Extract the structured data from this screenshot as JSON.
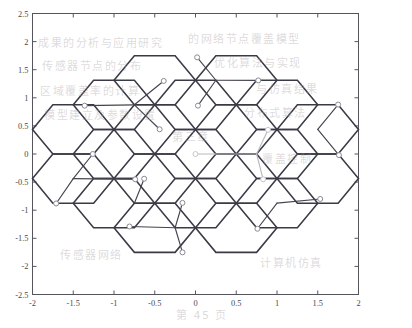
{
  "figure": {
    "title": "",
    "background_color": "#ffffff",
    "axes_color": "#55555d",
    "hex_edge_color": "#3a3a46",
    "star_line_color": "#44444e",
    "star_line_color_faded": "#b9b9c0",
    "marker_face_color": "#ffffff",
    "marker_edge_color": "#8a8a93",
    "marker_edge_color_faded": "#c7c7cd"
  },
  "chart_data": {
    "type": "scatter",
    "title": "",
    "xlabel": "",
    "ylabel": "",
    "xlim": [
      -2,
      2
    ],
    "ylim": [
      -2.5,
      2.5
    ],
    "grid": false,
    "legend": null,
    "xticks": [
      -2,
      -1.5,
      -1,
      -0.5,
      0,
      0.5,
      1,
      1.5,
      2
    ],
    "xticklabels": [
      "-2",
      "-1.5",
      "-1",
      "-0.5",
      "0",
      "0.5",
      "1",
      "1.5",
      "2"
    ],
    "yticks": [
      -2.5,
      -2,
      -1.5,
      -1,
      -0.5,
      0,
      0.5,
      1,
      1.5,
      2,
      2.5
    ],
    "yticklabels": [
      "-2.5",
      "-2",
      "-1.5",
      "-1",
      "-0.5",
      "0",
      "0.5",
      "1",
      "1.5",
      "2",
      "2.5"
    ],
    "hex_geometry": {
      "circumradius": 0.5,
      "flat_half_width": 0.433,
      "orientation": "pointy-left-right",
      "centers": [
        [
          -1.5,
          1.75
        ],
        [
          -0.5,
          1.75
        ],
        [
          0.5,
          1.75
        ],
        [
          1.5,
          1.75
        ],
        [
          -1.5,
          0.875
        ],
        [
          -0.5,
          0.875
        ],
        [
          0.5,
          0.875
        ],
        [
          1.5,
          0.875
        ],
        [
          -1.0,
          1.3125
        ],
        [
          0.0,
          1.3125
        ],
        [
          1.0,
          1.3125
        ]
      ],
      "note": "Actual rendered lattice is built programmatically in the template from row/column offsets; see hex_rows."
    },
    "hex_rows": [
      {
        "y": 1.3125,
        "x_centers": [
          0.0
        ]
      },
      {
        "y": 0.4375,
        "x_centers": [
          -0.75,
          0.0,
          0.75
        ]
      },
      {
        "y": 0.0,
        "x_centers": [
          -1.5,
          -0.75,
          0.0,
          0.75,
          1.5
        ]
      },
      {
        "y": -0.4375,
        "x_centers": [
          -1.5,
          -0.75,
          0.0,
          0.75,
          1.5
        ]
      },
      {
        "y": -1.3125,
        "x_centers": [
          0.0
        ]
      }
    ],
    "stars": [
      {
        "id": "star-1",
        "origin": [
          -0.75,
          0.875
        ],
        "faded": false,
        "arms": [
          {
            "angle_deg": 55,
            "length": 0.62,
            "endpoint": [
              -0.39,
              1.3
            ]
          },
          {
            "angle_deg": 175,
            "length": 0.62,
            "endpoint": [
              -1.36,
              0.86
            ]
          },
          {
            "angle_deg": -60,
            "length": 0.62,
            "endpoint": [
              -0.44,
              0.44
            ]
          }
        ]
      },
      {
        "id": "star-2",
        "origin": [
          0.25,
          1.3125
        ],
        "faded": false,
        "arms": [
          {
            "angle_deg": 100,
            "length": 0.5,
            "endpoint": [
              0.02,
              1.72
            ]
          },
          {
            "angle_deg": 5,
            "length": 0.52,
            "endpoint": [
              0.77,
              1.31
            ]
          },
          {
            "angle_deg": -105,
            "length": 0.62,
            "endpoint": [
              0.03,
              0.86
            ]
          }
        ]
      },
      {
        "id": "star-3",
        "origin": [
          1.5,
          0.4375
        ],
        "faded": false,
        "arms": [
          {
            "angle_deg": 62,
            "length": 0.58,
            "endpoint": [
              1.75,
              0.88
            ]
          },
          {
            "angle_deg": -62,
            "length": 0.58,
            "endpoint": [
              1.76,
              -0.02
            ]
          },
          {
            "angle_deg": 180,
            "length": 0.0,
            "endpoint": [
              1.5,
              0.4375
            ]
          }
        ]
      },
      {
        "id": "star-4",
        "origin": [
          0.75,
          0.0
        ],
        "faded": true,
        "arms": [
          {
            "angle_deg": 72,
            "length": 0.45,
            "endpoint": [
              0.89,
              0.43
            ]
          },
          {
            "angle_deg": 180,
            "length": 0.75,
            "endpoint": [
              0.0,
              0.0
            ]
          },
          {
            "angle_deg": -80,
            "length": 0.46,
            "endpoint": [
              0.83,
              -0.45
            ]
          }
        ]
      },
      {
        "id": "star-5",
        "origin": [
          -1.5,
          -0.4375
        ],
        "faded": false,
        "arms": [
          {
            "angle_deg": 60,
            "length": 0.48,
            "endpoint": [
              -1.26,
              0.0
            ]
          },
          {
            "angle_deg": -5,
            "length": 0.76,
            "endpoint": [
              -0.74,
              -0.45
            ]
          },
          {
            "angle_deg": -115,
            "length": 0.5,
            "endpoint": [
              -1.71,
              -0.88
            ]
          }
        ]
      },
      {
        "id": "star-6",
        "origin": [
          -0.75,
          -0.875
        ],
        "faded": false,
        "arms": [
          {
            "angle_deg": 75,
            "length": 0.45,
            "endpoint": [
              -0.63,
              -0.44
            ]
          },
          {
            "angle_deg": 2,
            "length": 0.0,
            "endpoint": [
              -0.75,
              -0.875
            ]
          },
          {
            "angle_deg": -95,
            "length": 0.0,
            "endpoint": [
              -0.75,
              -0.875
            ]
          }
        ]
      },
      {
        "id": "star-7",
        "origin": [
          -0.25,
          -1.3125
        ],
        "faded": false,
        "arms": [
          {
            "angle_deg": 78,
            "length": 0.46,
            "endpoint": [
              -0.16,
              -0.87
            ]
          },
          {
            "angle_deg": 178,
            "length": 0.56,
            "endpoint": [
              -0.81,
              -1.29
            ]
          },
          {
            "angle_deg": -78,
            "length": 0.46,
            "endpoint": [
              -0.16,
              -1.75
            ]
          }
        ]
      },
      {
        "id": "star-8",
        "origin": [
          1.0,
          -0.875
        ],
        "faded": false,
        "arms": [
          {
            "angle_deg": 8,
            "length": 0.54,
            "endpoint": [
              1.53,
              -0.8
            ]
          },
          {
            "angle_deg": -118,
            "length": 0.52,
            "endpoint": [
              0.76,
              -1.33
            ]
          },
          {
            "angle_deg": 150,
            "length": 0.0,
            "endpoint": [
              1.0,
              -0.875
            ]
          }
        ]
      },
      {
        "id": "star-9",
        "origin": [
          1.5,
          -0.4375
        ],
        "faded": false,
        "arms": [
          {
            "angle_deg": 58,
            "length": 0.0,
            "endpoint": [
              1.5,
              -0.4375
            ]
          },
          {
            "angle_deg": 0,
            "length": 0.0,
            "endpoint": [
              1.5,
              -0.4375
            ]
          },
          {
            "angle_deg": 0,
            "length": 0.0,
            "endpoint": [
              1.5,
              -0.4375
            ]
          }
        ]
      }
    ],
    "markers": [
      [
        -0.39,
        1.3
      ],
      [
        -1.36,
        0.86
      ],
      [
        -0.44,
        0.44
      ],
      [
        0.02,
        1.72
      ],
      [
        0.77,
        1.31
      ],
      [
        0.03,
        0.86
      ],
      [
        1.75,
        0.88
      ],
      [
        1.76,
        -0.02
      ],
      [
        0.89,
        0.43
      ],
      [
        0.0,
        0.0
      ],
      [
        0.83,
        -0.45
      ],
      [
        -1.26,
        0.0
      ],
      [
        -0.74,
        -0.45
      ],
      [
        -1.71,
        -0.88
      ],
      [
        -0.63,
        -0.44
      ],
      [
        -0.16,
        -0.87
      ],
      [
        -0.81,
        -1.29
      ],
      [
        -0.16,
        -1.75
      ],
      [
        1.53,
        -0.8
      ],
      [
        0.76,
        -1.33
      ]
    ]
  },
  "artifacts": {
    "description": "faint show-through text from reverse side of scanned page",
    "lines": [
      {
        "text": "成果的分析与应用研究",
        "x": 38,
        "y": 34
      },
      {
        "text": "的网络节点覆盖模型",
        "x": 188,
        "y": 30
      },
      {
        "text": "传感器节点的分布",
        "x": 42,
        "y": 57
      },
      {
        "text": "优化算法与实现",
        "x": 214,
        "y": 54
      },
      {
        "text": "区域覆盖率的计算",
        "x": 40,
        "y": 82
      },
      {
        "text": "与仿真结果",
        "x": 256,
        "y": 80
      },
      {
        "text": "模型建立及参数设置",
        "x": 44,
        "y": 106
      },
      {
        "text": "分布式算法",
        "x": 244,
        "y": 104
      },
      {
        "text": "第三章",
        "x": 172,
        "y": 128
      },
      {
        "text": "覆盖控制",
        "x": 262,
        "y": 150
      },
      {
        "text": "传感器网络",
        "x": 60,
        "y": 246
      },
      {
        "text": "计算机仿真",
        "x": 260,
        "y": 254
      },
      {
        "text": "第 45 页",
        "x": 176,
        "y": 306
      }
    ]
  }
}
